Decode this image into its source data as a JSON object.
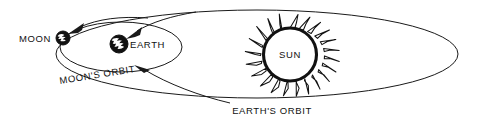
{
  "diagram": {
    "background_color": "#ffffff",
    "ink_color": "#111111",
    "labels": {
      "moon": "MOON",
      "earth": "EARTH",
      "sun": "SUN",
      "moons_orbit": "MOON'S ORBIT",
      "earths_orbit": "EARTH'S ORBIT"
    },
    "bodies": [
      {
        "name": "moon",
        "label": "MOON",
        "cx": 63,
        "cy": 38,
        "r": 7,
        "style": "filled-disc-with-white-markings"
      },
      {
        "name": "earth",
        "label": "EARTH",
        "cx": 119,
        "cy": 44,
        "r": 9,
        "style": "filled-disc-with-white-continents"
      },
      {
        "name": "sun",
        "label": "SUN",
        "cx": 290,
        "cy": 57,
        "r": 29,
        "style": "open-disc-with-flame-corona",
        "ray_count": 20
      }
    ],
    "orbits": [
      {
        "name": "moons-orbit",
        "label": "MOON'S ORBIT",
        "cx": 121,
        "cy": 47,
        "rx": 61,
        "ry": 25
      },
      {
        "name": "earths-orbit",
        "label": "EARTH'S ORBIT",
        "cx": 257,
        "cy": 54,
        "rx": 201,
        "ry": 44
      }
    ],
    "pointers": [
      {
        "name": "moon-pointer",
        "target": "moon",
        "direction": "from-upper-right"
      },
      {
        "name": "earth-pointer",
        "target": "earth",
        "direction": "from-upper-right"
      },
      {
        "name": "moons-orbit-pointer",
        "target": "moons-orbit",
        "direction": "from-lower-right"
      }
    ]
  }
}
